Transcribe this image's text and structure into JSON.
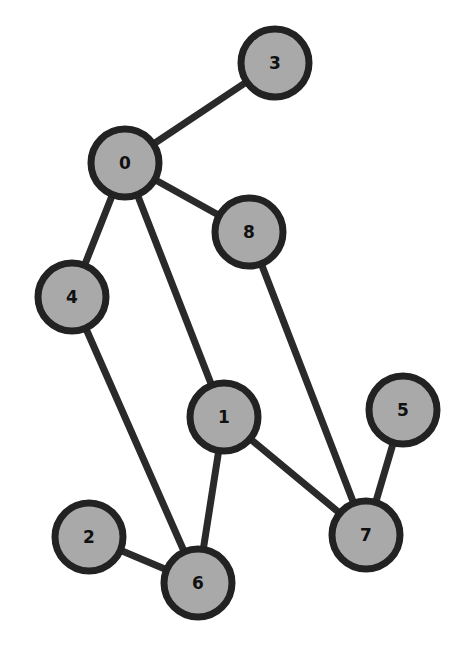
{
  "diagram": {
    "type": "undirected-graph",
    "style": {
      "node_fill": "#a9a9a9",
      "node_stroke": "#222222",
      "edge_color": "#2a2a2a",
      "background": "#ffffff",
      "node_radius": 34
    },
    "nodes": [
      {
        "id": "0",
        "label": "0",
        "x": 125,
        "y": 163
      },
      {
        "id": "1",
        "label": "1",
        "x": 224,
        "y": 417
      },
      {
        "id": "2",
        "label": "2",
        "x": 89,
        "y": 537
      },
      {
        "id": "3",
        "label": "3",
        "x": 275,
        "y": 63
      },
      {
        "id": "4",
        "label": "4",
        "x": 72,
        "y": 297
      },
      {
        "id": "5",
        "label": "5",
        "x": 403,
        "y": 410
      },
      {
        "id": "6",
        "label": "6",
        "x": 198,
        "y": 583
      },
      {
        "id": "7",
        "label": "7",
        "x": 366,
        "y": 535
      },
      {
        "id": "8",
        "label": "8",
        "x": 249,
        "y": 232
      }
    ],
    "edges": [
      {
        "from": "0",
        "to": "3"
      },
      {
        "from": "0",
        "to": "8"
      },
      {
        "from": "0",
        "to": "4"
      },
      {
        "from": "0",
        "to": "1"
      },
      {
        "from": "8",
        "to": "7"
      },
      {
        "from": "4",
        "to": "6"
      },
      {
        "from": "1",
        "to": "6"
      },
      {
        "from": "1",
        "to": "7"
      },
      {
        "from": "5",
        "to": "7"
      },
      {
        "from": "2",
        "to": "6"
      }
    ]
  }
}
